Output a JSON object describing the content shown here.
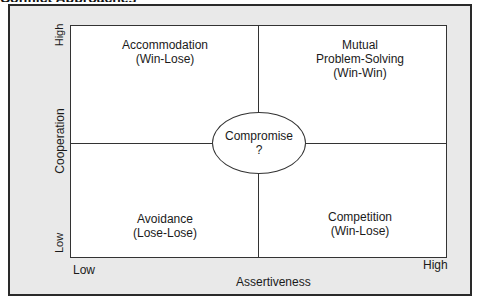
{
  "heading": {
    "text": "Conflict Approaches"
  },
  "axes": {
    "y_label": "Cooperation",
    "y_high": "High",
    "y_low": "Low",
    "x_label": "Assertiveness",
    "x_low": "Low",
    "x_high": "High"
  },
  "quadrants": {
    "top_left": {
      "title": "Accommodation",
      "sub": "(Win-Lose)"
    },
    "top_right": {
      "line1": "Mutual",
      "line2": "Problem-Solving",
      "sub": "(Win-Win)"
    },
    "bottom_left": {
      "title": "Avoidance",
      "sub": "(Lose-Lose)"
    },
    "bottom_right": {
      "title": "Competition",
      "sub": "(Win-Lose)"
    }
  },
  "center": {
    "title": "Compromise",
    "mark": "?"
  },
  "colors": {
    "frame_bg": "#e9e9e9",
    "grid_bg": "#ffffff",
    "line": "#333333"
  }
}
